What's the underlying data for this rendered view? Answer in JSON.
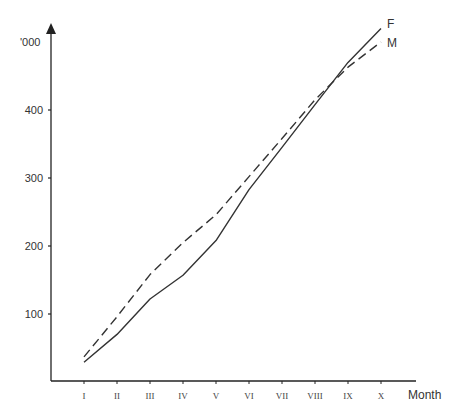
{
  "chart_data": {
    "type": "line",
    "title": "",
    "xlabel": "Month",
    "ylabel": "'000",
    "categories": [
      "I",
      "II",
      "III",
      "IV",
      "V",
      "VI",
      "VII",
      "VIII",
      "IX",
      "X"
    ],
    "yticks": [
      100,
      200,
      300,
      400
    ],
    "ylim": [
      0,
      540
    ],
    "grid": false,
    "legend_position": "inline-end-labels",
    "series": [
      {
        "name": "F",
        "style": "solid",
        "values": [
          29,
          70,
          122,
          157,
          208,
          283,
          345,
          408,
          470,
          520
        ]
      },
      {
        "name": "M",
        "style": "dashed",
        "values": [
          37,
          96,
          158,
          205,
          246,
          302,
          358,
          415,
          463,
          500
        ]
      }
    ]
  },
  "colors": {
    "axis": "#222222",
    "line": "#333333",
    "text": "#333333"
  }
}
